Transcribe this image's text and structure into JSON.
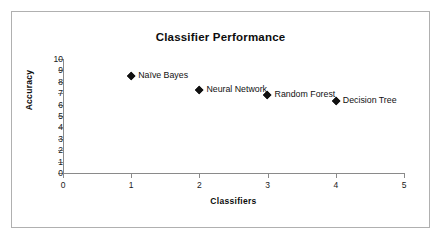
{
  "chart_data": {
    "type": "scatter",
    "title": "Classifier Performance",
    "xlabel": "Classifiers",
    "ylabel": "Accuracy",
    "xlim": [
      0,
      5
    ],
    "ylim": [
      0,
      10
    ],
    "xticks": [
      "0",
      "1",
      "2",
      "3",
      "4",
      "5"
    ],
    "yticks": [
      "0",
      "1",
      "2",
      "3",
      "4",
      "5",
      "6",
      "7",
      "8",
      "9",
      "10"
    ],
    "grid": false,
    "legend": "none",
    "marker_style": "diamond",
    "marker_color": "#111111",
    "points": [
      {
        "label": "Naïve Bayes",
        "x": 1,
        "y": 8.5
      },
      {
        "label": "Neural Network",
        "x": 2,
        "y": 7.3
      },
      {
        "label": "Random Forest",
        "x": 3,
        "y": 6.8
      },
      {
        "label": "Decision Tree",
        "x": 4,
        "y": 6.3
      }
    ]
  },
  "frame": {
    "border_color": "#b0b0b0",
    "background": "#ffffff"
  }
}
